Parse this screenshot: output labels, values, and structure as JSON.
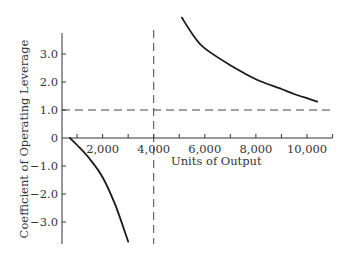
{
  "chart_data": {
    "type": "line",
    "title": "",
    "xlabel": "Units of Output",
    "ylabel": "Coefficient of Operating Leverage",
    "xlim": [
      400,
      10900
    ],
    "ylim": [
      -3.8,
      3.8
    ],
    "x_ticks": [
      1000,
      2000,
      3000,
      4000,
      5000,
      6000,
      7000,
      8000,
      9000,
      10000,
      11000
    ],
    "x_tick_labels": [
      {
        "value": 2000,
        "label": "2,000"
      },
      {
        "value": 4000,
        "label": "4,000"
      },
      {
        "value": 6000,
        "label": "6,000"
      },
      {
        "value": 8000,
        "label": "8,000"
      },
      {
        "value": 10000,
        "label": "10,000"
      }
    ],
    "y_ticks": [
      {
        "value": 3.0,
        "label": "3.0"
      },
      {
        "value": 2.0,
        "label": "2.0"
      },
      {
        "value": 1.0,
        "label": "1.0"
      },
      {
        "value": 0,
        "label": "0"
      },
      {
        "value": -1.0,
        "label": "−1.0"
      },
      {
        "value": -2.0,
        "label": "−2.0"
      },
      {
        "value": -3.0,
        "label": "−3.0"
      }
    ],
    "grid": false,
    "series": [
      {
        "name": "DOL below break-even",
        "x": [
          720,
          1000,
          1500,
          2000,
          2500,
          3000
        ],
        "y": [
          0.0,
          -0.25,
          -0.75,
          -1.4,
          -2.4,
          -3.7
        ]
      },
      {
        "name": "DOL above break-even",
        "x": [
          5100,
          5600,
          6000,
          7000,
          8000,
          9000,
          9500,
          10000,
          10400
        ],
        "y": [
          4.3,
          3.6,
          3.2,
          2.6,
          2.1,
          1.75,
          1.57,
          1.42,
          1.3
        ]
      }
    ],
    "reference_lines": [
      {
        "orientation": "horizontal",
        "value": 1.0,
        "style": "dashed"
      },
      {
        "orientation": "vertical",
        "value": 4000,
        "style": "dashed"
      }
    ]
  },
  "colors": {
    "axis": "#333333",
    "curve": "#1a1a1a",
    "dashed": "#444444",
    "text": "#333333"
  }
}
